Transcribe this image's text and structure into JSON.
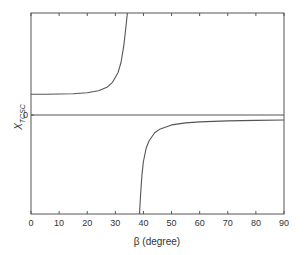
{
  "chart_data": {
    "type": "line",
    "title": "",
    "xlabel": "β (degree)",
    "ylabel": "X",
    "ylabel_subscript": "TCSC",
    "xlim": [
      0,
      90
    ],
    "ylim": [
      -1.0,
      1.03
    ],
    "xticks": [
      0,
      10,
      20,
      30,
      40,
      50,
      60,
      70,
      80,
      90
    ],
    "yticks": [
      0
    ],
    "ytick_labels": [
      "0"
    ],
    "grid": false,
    "legend": null,
    "zero_line": true,
    "resonance_range_deg": [
      34.3,
      38.6
    ],
    "series": [
      {
        "name": "X_TCSC (inductive branch)",
        "x": [
          0,
          5,
          10,
          15,
          20,
          24,
          27,
          29,
          31,
          32,
          33,
          33.7,
          34.3
        ],
        "y": [
          0.21,
          0.21,
          0.212,
          0.215,
          0.225,
          0.245,
          0.28,
          0.33,
          0.43,
          0.53,
          0.7,
          0.87,
          1.03
        ]
      },
      {
        "name": "X_TCSC (capacitive branch)",
        "x": [
          38.6,
          39,
          39.5,
          40,
          41,
          42,
          44,
          46,
          50,
          55,
          60,
          70,
          80,
          90
        ],
        "y": [
          -1.0,
          -0.8,
          -0.6,
          -0.47,
          -0.33,
          -0.26,
          -0.18,
          -0.14,
          -0.1,
          -0.08,
          -0.07,
          -0.06,
          -0.055,
          -0.05
        ]
      }
    ]
  }
}
